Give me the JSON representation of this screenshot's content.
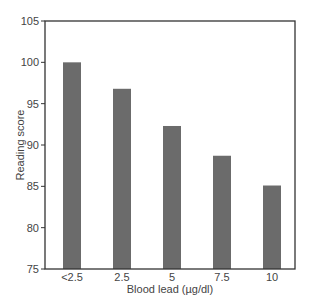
{
  "chart_data": {
    "type": "bar",
    "title": "",
    "xlabel": "Blood lead (µg/dl)",
    "ylabel": "Reading score",
    "categories": [
      "<2.5",
      "2.5",
      "5",
      "7.5",
      "10"
    ],
    "values": [
      100.0,
      96.8,
      92.3,
      88.7,
      85.1
    ],
    "ylim": [
      75,
      105
    ],
    "yticks": [
      75,
      80,
      85,
      90,
      95,
      100,
      105
    ],
    "grid": false,
    "legend": null,
    "bar_color": "#6b6b6b",
    "frame_color": "#333333"
  }
}
